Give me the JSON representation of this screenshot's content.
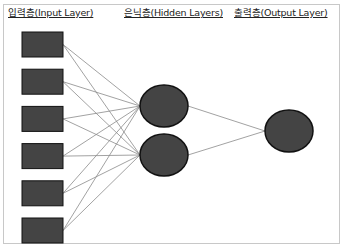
{
  "labels": {
    "input_layer": "입력층(Input Layer)",
    "hidden_layers": "은닉층(Hidden Layers)",
    "output_layer": "출력층(Output Layer)"
  },
  "network": {
    "input_nodes": 6,
    "hidden_nodes": 2,
    "output_nodes": 1,
    "fully_connected": true
  },
  "colors": {
    "node_fill": "#444444",
    "node_stroke": "#111111",
    "edge": "#8a8a8a",
    "frame": "#c8c8c8"
  }
}
